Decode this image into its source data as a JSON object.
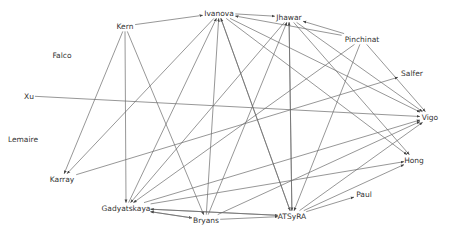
{
  "diagram": {
    "type": "directed-graph",
    "nodes": [
      {
        "id": "Ivanova",
        "label": "Ivanova",
        "x": 219,
        "y": 13
      },
      {
        "id": "Kern",
        "label": "Kern",
        "x": 125,
        "y": 26
      },
      {
        "id": "Jhawar",
        "label": "Jhawar",
        "x": 289,
        "y": 17
      },
      {
        "id": "Pinchinat",
        "label": "Pinchinat",
        "x": 362,
        "y": 39
      },
      {
        "id": "Salfer",
        "label": "Salfer",
        "x": 412,
        "y": 73
      },
      {
        "id": "Falco",
        "label": "Falco",
        "x": 62,
        "y": 55
      },
      {
        "id": "Xu",
        "label": "Xu",
        "x": 29,
        "y": 96
      },
      {
        "id": "Vigo",
        "label": "Vigo",
        "x": 430,
        "y": 117
      },
      {
        "id": "Lemaire",
        "label": "Lemaire",
        "x": 23,
        "y": 139
      },
      {
        "id": "Hong",
        "label": "Hong",
        "x": 414,
        "y": 160
      },
      {
        "id": "Karray",
        "label": "Karray",
        "x": 62,
        "y": 179
      },
      {
        "id": "Paul",
        "label": "Paul",
        "x": 364,
        "y": 194
      },
      {
        "id": "Gadyatskaya",
        "label": "Gadyatskaya",
        "x": 126,
        "y": 208
      },
      {
        "id": "Bryans",
        "label": "Bryans",
        "x": 206,
        "y": 220
      },
      {
        "id": "ATSyRA",
        "label": "ATSyRA",
        "x": 292,
        "y": 216
      }
    ],
    "edges": [
      {
        "from": "Kern",
        "to": "Ivanova"
      },
      {
        "from": "Kern",
        "to": "Karray"
      },
      {
        "from": "Kern",
        "to": "Gadyatskaya"
      },
      {
        "from": "Kern",
        "to": "Bryans"
      },
      {
        "from": "Ivanova",
        "to": "Jhawar"
      },
      {
        "from": "Ivanova",
        "to": "Vigo"
      },
      {
        "from": "Ivanova",
        "to": "Hong"
      },
      {
        "from": "Ivanova",
        "to": "ATSyRA"
      },
      {
        "from": "Ivanova",
        "to": "Karray"
      },
      {
        "from": "Pinchinat",
        "to": "Ivanova"
      },
      {
        "from": "Pinchinat",
        "to": "Jhawar"
      },
      {
        "from": "Pinchinat",
        "to": "Vigo"
      },
      {
        "from": "Pinchinat",
        "to": "Gadyatskaya"
      },
      {
        "from": "Pinchinat",
        "to": "ATSyRA"
      },
      {
        "from": "Jhawar",
        "to": "Vigo"
      },
      {
        "from": "Jhawar",
        "to": "Hong"
      },
      {
        "from": "Jhawar",
        "to": "ATSyRA"
      },
      {
        "from": "Jhawar",
        "to": "Gadyatskaya"
      },
      {
        "from": "Xu",
        "to": "Vigo"
      },
      {
        "from": "Karray",
        "to": "Salfer"
      },
      {
        "from": "Gadyatskaya",
        "to": "Ivanova"
      },
      {
        "from": "Gadyatskaya",
        "to": "Vigo"
      },
      {
        "from": "Gadyatskaya",
        "to": "Hong"
      },
      {
        "from": "Gadyatskaya",
        "to": "Bryans"
      },
      {
        "from": "Gadyatskaya",
        "to": "ATSyRA"
      },
      {
        "from": "Bryans",
        "to": "Ivanova"
      },
      {
        "from": "Bryans",
        "to": "Jhawar"
      },
      {
        "from": "Bryans",
        "to": "Gadyatskaya"
      },
      {
        "from": "Bryans",
        "to": "Vigo"
      },
      {
        "from": "Bryans",
        "to": "ATSyRA"
      },
      {
        "from": "ATSyRA",
        "to": "Ivanova"
      },
      {
        "from": "ATSyRA",
        "to": "Jhawar"
      },
      {
        "from": "ATSyRA",
        "to": "Vigo"
      },
      {
        "from": "ATSyRA",
        "to": "Hong"
      },
      {
        "from": "ATSyRA",
        "to": "Paul"
      },
      {
        "from": "ATSyRA",
        "to": "Gadyatskaya"
      }
    ]
  },
  "colors": {
    "edge": "#6a6a6a",
    "label": "#333333",
    "background": "#ffffff"
  }
}
